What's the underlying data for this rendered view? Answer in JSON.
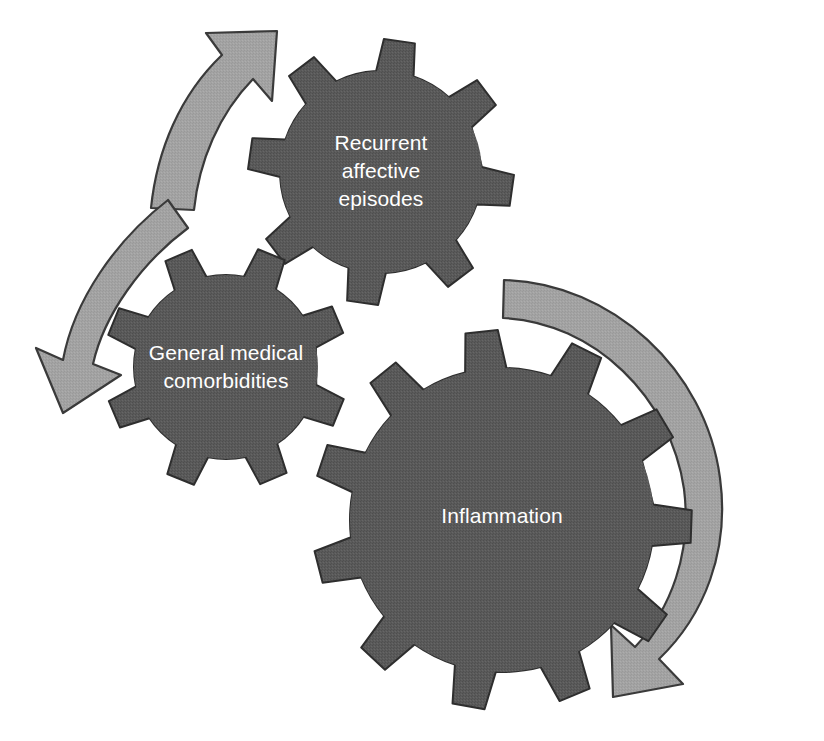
{
  "figure": {
    "type": "cycle-diagram",
    "background_color": "#ffffff",
    "gear_fill_color": "#5a5a5a",
    "gear_outline_color": "#2e2e2e",
    "arrow_fill_color": "#a3a3a3",
    "arrow_outline_color": "#3a3a3a",
    "label_text_color": "#ffffff"
  },
  "gears": [
    {
      "id": "recurrent-affective-episodes",
      "label_lines": [
        "Recurrent",
        "affective",
        "episodes"
      ],
      "teeth": 8,
      "center_x": 381,
      "center_y": 172,
      "outer_radius": 133,
      "inner_radius": 101,
      "rotation_deg": 8
    },
    {
      "id": "general-medical-comorbidities",
      "label_lines": [
        "General medical",
        "comorbidities"
      ],
      "teeth": 8,
      "center_x": 226,
      "center_y": 367,
      "outer_radius": 122,
      "inner_radius": 92,
      "rotation_deg": 22
    },
    {
      "id": "inflammation",
      "label_lines": [
        "Inflammation"
      ],
      "teeth": 11,
      "center_x": 502,
      "center_y": 520,
      "outer_radius": 190,
      "inner_radius": 152,
      "rotation_deg": 2
    }
  ],
  "arrows": [
    {
      "id": "arrow-upward-left",
      "direction": "up-right",
      "description": "Curved arrow sweeping up and to the right toward the recurrent affective episodes gear"
    },
    {
      "id": "arrow-downward-left",
      "direction": "down-left",
      "description": "Curved arrow sweeping down and to the left past the general medical comorbidities gear"
    },
    {
      "id": "arrow-right-sweep",
      "direction": "clockwise-down",
      "description": "Large curved arrow sweeping clockwise around the right side of the inflammation gear"
    }
  ]
}
